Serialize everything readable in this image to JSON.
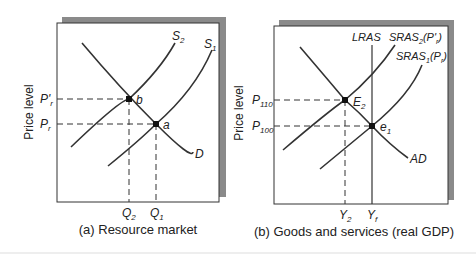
{
  "panel_a": {
    "caption": "(a) Resource market",
    "ylabel": "Price level",
    "curves": {
      "s2": "S",
      "s2_sub": "2",
      "s1": "S",
      "s1_sub": "1",
      "d": "D"
    },
    "points": {
      "b": "b",
      "a": "a"
    },
    "y_ticks": {
      "p_prime": "P'",
      "p_prime_sub": "r",
      "p": "P",
      "p_sub": "r"
    },
    "x_ticks": {
      "q2": "Q",
      "q2_sub": "2",
      "q1": "Q",
      "q1_sub": "1"
    }
  },
  "panel_b": {
    "caption": "(b) Goods and services (real GDP)",
    "ylabel": "Price level",
    "curves": {
      "lras": "LRAS",
      "sras2": "SRAS",
      "sras2_sub": "2",
      "sras2_arg": "(P'",
      "sras2_arg_sub": "r",
      "sras2_close": ")",
      "sras1": "SRAS",
      "sras1_sub": "1",
      "sras1_arg": "(P",
      "sras1_arg_sub": "r",
      "sras1_close": ")",
      "ad": "AD"
    },
    "points": {
      "e2": "E",
      "e2_sub": "2",
      "e1": "e",
      "e1_sub": "1"
    },
    "y_ticks": {
      "p110": "P",
      "p110_sub": "110",
      "p100": "P",
      "p100_sub": "100"
    },
    "x_ticks": {
      "y2": "Y",
      "y2_sub": "2",
      "yf": "Y",
      "yf_sub": "f"
    }
  }
}
